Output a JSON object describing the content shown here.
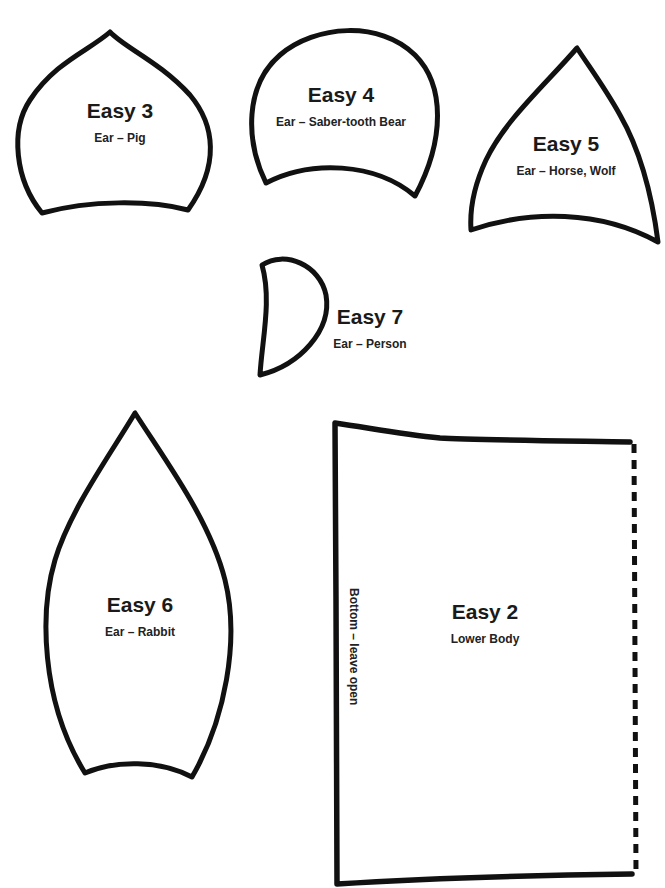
{
  "page": {
    "background": "#ffffff",
    "stroke_color": "#111111"
  },
  "pieces": {
    "easy3": {
      "title": "Easy 3",
      "subtitle": "Ear – Pig"
    },
    "easy4": {
      "title": "Easy 4",
      "subtitle": "Ear – Saber-tooth Bear"
    },
    "easy5": {
      "title": "Easy 5",
      "subtitle": "Ear – Horse, Wolf"
    },
    "easy7": {
      "title": "Easy 7",
      "subtitle": "Ear – Person"
    },
    "easy6": {
      "title": "Easy 6",
      "subtitle": "Ear – Rabbit"
    },
    "easy2": {
      "title": "Easy 2",
      "subtitle": "Lower Body",
      "edge_note": "Bottom – leave open"
    }
  }
}
